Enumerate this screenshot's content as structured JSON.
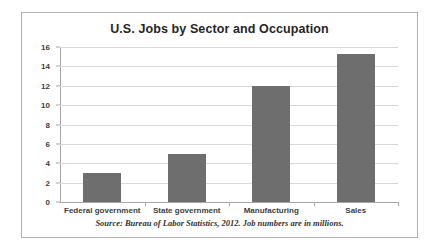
{
  "chart_data": {
    "type": "bar",
    "title": "U.S. Jobs by Sector and Occupation",
    "categories": [
      "Federal government",
      "State government",
      "Manufacturing",
      "Sales"
    ],
    "values": [
      3,
      5,
      12,
      15.3
    ],
    "xlabel": "",
    "ylabel": "",
    "ylim": [
      0,
      16
    ],
    "yticks": [
      0,
      2,
      4,
      6,
      8,
      10,
      12,
      14,
      16
    ],
    "ytick_labels": [
      "0",
      "2",
      "4",
      "6",
      "8",
      "10",
      "12",
      "14",
      "16"
    ],
    "grid": true,
    "legend": false,
    "bar_color": "#6e6e6e",
    "gridline_color": "#d9d9d9",
    "axis_color": "#a6a6a6",
    "source_note": "Source: Bureau of Labor Statistics, 2012.  Job numbers are in millions."
  }
}
